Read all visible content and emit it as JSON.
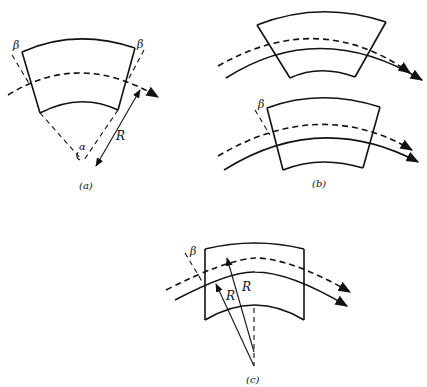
{
  "diagram": {
    "type": "magnet sector geometry figure",
    "panels": [
      {
        "id": "a",
        "caption": "(a)",
        "labels": {
          "beta_left": "β",
          "beta_right": "β",
          "alpha": "α",
          "radius": "R"
        },
        "description": "Sector magnet with entrance/exit edge angles β, bend angle α, radius R; dashed beam trajectory"
      },
      {
        "id": "b",
        "caption": "(b)",
        "labels": {
          "beta": "β"
        },
        "description": "Two sector magnets with solid and dashed trajectories"
      },
      {
        "id": "c",
        "caption": "(c)",
        "labels": {
          "beta": "β",
          "radius_1": "R",
          "radius_2": "R"
        },
        "description": "Rectangular-edge magnet with two trajectories of equal radius R"
      }
    ]
  }
}
